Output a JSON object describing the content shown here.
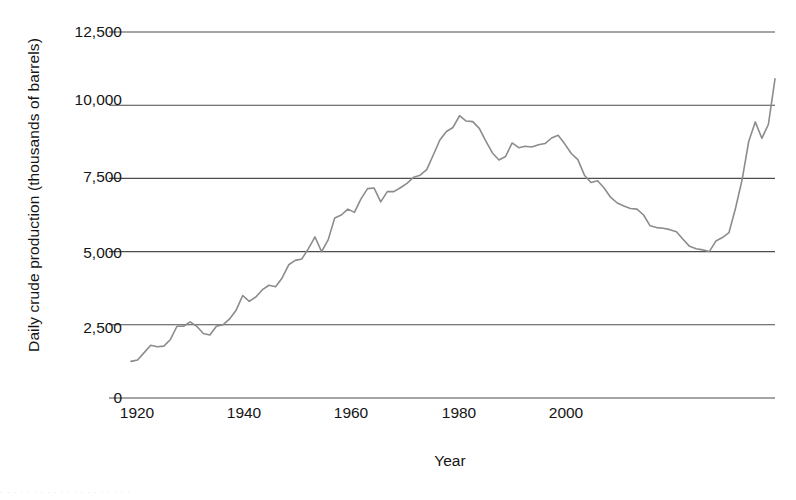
{
  "chart_data": {
    "type": "line",
    "title": "",
    "xlabel": "Year",
    "ylabel": "Daily crude production (thousands of barrels)",
    "xlim": [
      1920,
      2018
    ],
    "ylim": [
      0,
      12500
    ],
    "xticks": [
      1920,
      1940,
      1960,
      1980,
      2000
    ],
    "xtick_labels": [
      "1920",
      "1940",
      "1960",
      "1980",
      "2000"
    ],
    "yticks": [
      0,
      2500,
      5000,
      7500,
      10000,
      12500
    ],
    "ytick_labels": [
      "0",
      "2,500",
      "5,000",
      "7,500",
      "10,000",
      "12,500"
    ],
    "grid": "horizontal",
    "legend": "none",
    "line_color": "#8c8c8c",
    "line_width": 1.6,
    "series": [
      {
        "name": "Daily crude production",
        "x": [
          1920,
          1921,
          1922,
          1923,
          1924,
          1925,
          1926,
          1927,
          1928,
          1929,
          1930,
          1931,
          1932,
          1933,
          1934,
          1935,
          1936,
          1937,
          1938,
          1939,
          1940,
          1941,
          1942,
          1943,
          1944,
          1945,
          1946,
          1947,
          1948,
          1949,
          1950,
          1951,
          1952,
          1953,
          1954,
          1955,
          1956,
          1957,
          1958,
          1959,
          1960,
          1961,
          1962,
          1963,
          1964,
          1965,
          1966,
          1967,
          1968,
          1969,
          1970,
          1971,
          1972,
          1973,
          1974,
          1975,
          1976,
          1977,
          1978,
          1979,
          1980,
          1981,
          1982,
          1983,
          1984,
          1985,
          1986,
          1987,
          1988,
          1989,
          1990,
          1991,
          1992,
          1993,
          1994,
          1995,
          1996,
          1997,
          1998,
          1999,
          2000,
          2001,
          2002,
          2003,
          2004,
          2005,
          2006,
          2007,
          2008,
          2009,
          2010,
          2011,
          2012,
          2013,
          2014,
          2015,
          2016,
          2017,
          2018
        ],
        "values": [
          1250,
          1300,
          1550,
          1800,
          1750,
          1770,
          2000,
          2450,
          2450,
          2600,
          2450,
          2200,
          2150,
          2450,
          2500,
          2700,
          3000,
          3500,
          3300,
          3450,
          3700,
          3850,
          3800,
          4100,
          4550,
          4700,
          4750,
          5100,
          5500,
          5000,
          5400,
          6150,
          6250,
          6450,
          6340,
          6800,
          7150,
          7170,
          6700,
          7050,
          7050,
          7180,
          7330,
          7540,
          7610,
          7800,
          8300,
          8810,
          9100,
          9240,
          9640,
          9460,
          9440,
          9210,
          8770,
          8370,
          8130,
          8250,
          8710,
          8550,
          8600,
          8570,
          8650,
          8690,
          8880,
          8970,
          8680,
          8350,
          8140,
          7610,
          7360,
          7420,
          7170,
          6850,
          6660,
          6560,
          6470,
          6450,
          6250,
          5880,
          5820,
          5800,
          5750,
          5680,
          5420,
          5180,
          5100,
          5060,
          5000,
          5360,
          5480,
          5650,
          6490,
          7460,
          8760,
          9430,
          8870,
          9350,
          10900
        ]
      }
    ]
  },
  "caption_fragment": "· · · · · · · · · · · · · · · · · · · ·"
}
